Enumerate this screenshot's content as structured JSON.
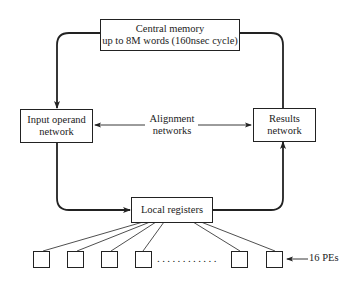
{
  "diagram": {
    "central_memory": {
      "line1": "Central memory",
      "line2": "up to 8M words (160nsec cycle)"
    },
    "input_network": {
      "line1": "Input operand",
      "line2": "network"
    },
    "results_network": {
      "line1": "Results",
      "line2": "network"
    },
    "alignment": {
      "line1": "Alignment",
      "line2": "networks"
    },
    "local_registers": {
      "label": "Local registers"
    },
    "processing_elements": {
      "visible_count": 6,
      "ellipsis": "............",
      "label": "16 PEs"
    },
    "colors": {
      "line": "#222222",
      "background": "#ffffff"
    }
  }
}
